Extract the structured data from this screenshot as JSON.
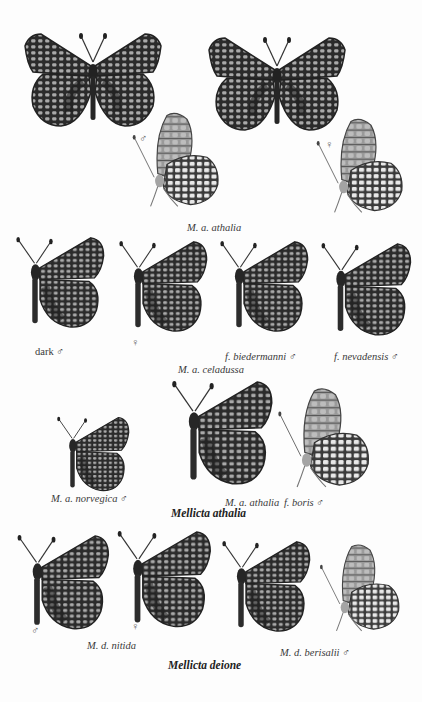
{
  "plate": {
    "background": "#fdfdfd",
    "wing_dark": "#2a2a2a",
    "wing_light": "#a8a8a8",
    "underside_base": "#9a9a9a",
    "underside_light": "#e6e6e6"
  },
  "row1": {
    "male_symbol": "♂",
    "female_symbol": "♀",
    "caption": "M. a. athalia"
  },
  "row2": {
    "label_dark": "dark",
    "label_dark_sex": "♂",
    "label_female": "♀",
    "label_biedermanni": "f. biedermanni",
    "label_biedermanni_sex": "♂",
    "label_nevadensis": "f. nevadensis",
    "label_nevadensis_sex": "♂",
    "caption": "M. a. celadussa"
  },
  "row3": {
    "label_norvegica": "M. a. norvegica",
    "label_norvegica_sex": "♂",
    "label_athalia": "M. a. athalia",
    "label_boris": "f. boris",
    "label_boris_sex": "♂",
    "species_title": "Mellicta athalia"
  },
  "row4": {
    "male_symbol": "♂",
    "female_symbol": "♀",
    "label_nitida": "M. d. nitida",
    "label_berisalii": "M. d. berisalii",
    "label_berisalii_sex": "♂",
    "species_title": "Mellicta deione"
  }
}
